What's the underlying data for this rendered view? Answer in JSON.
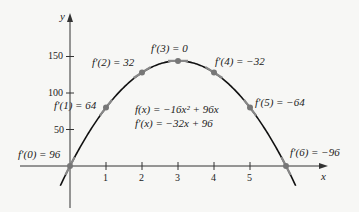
{
  "chart_data": {
    "type": "line",
    "title": "",
    "xlabel": "x",
    "ylabel": "y",
    "xlim": [
      -0.3,
      7.0
    ],
    "ylim": [
      -60,
      200
    ],
    "grid": false,
    "function": "f(x) = -16x^2 + 96x",
    "derivative": "f'(x) = -32x + 96",
    "x_ticks": [
      1,
      2,
      3,
      4,
      5
    ],
    "y_ticks": [
      50,
      100,
      150
    ],
    "series": [
      {
        "name": "f(x) = -16x^2 + 96x",
        "x": [
          0,
          1,
          2,
          3,
          4,
          5,
          6
        ],
        "y": [
          0,
          80,
          128,
          144,
          128,
          80,
          0
        ]
      }
    ],
    "points": [
      {
        "x": 0,
        "y": 0,
        "slope": 96,
        "label": "f′(0) = 96"
      },
      {
        "x": 1,
        "y": 80,
        "slope": 64,
        "label": "f′(1) = 64"
      },
      {
        "x": 2,
        "y": 128,
        "slope": 32,
        "label": "f′(2) = 32"
      },
      {
        "x": 3,
        "y": 144,
        "slope": 0,
        "label": "f′(3) = 0"
      },
      {
        "x": 4,
        "y": 128,
        "slope": -32,
        "label": "f′(4) = −32"
      },
      {
        "x": 5,
        "y": 80,
        "slope": -64,
        "label": "f′(5) = −64"
      },
      {
        "x": 6,
        "y": 0,
        "slope": -96,
        "label": "f′(6) = −96"
      }
    ]
  },
  "labels": {
    "y_axis": "y",
    "x_axis": "x",
    "func": "f(x) = −16x² + 96x",
    "deriv": "f′(x) = −32x + 96",
    "p0": "f′(0) = 96",
    "p1": "f′(1) = 64",
    "p2": "f′(2) = 32",
    "p3": "f′(3) = 0",
    "p4": "f′(4) = −32",
    "p5": "f′(5) = −64",
    "p6": "f′(6) = −96",
    "xt1": "1",
    "xt2": "2",
    "xt3": "3",
    "xt4": "4",
    "xt5": "5",
    "yt50": "50",
    "yt100": "100",
    "yt150": "150"
  }
}
